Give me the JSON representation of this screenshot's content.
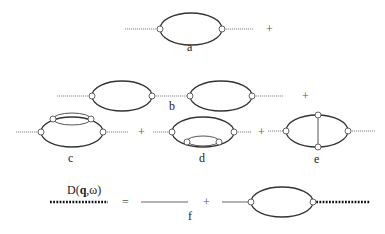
{
  "figure": {
    "diagrams": [
      {
        "id": "a",
        "label": "a",
        "description": "single bubble (polarization loop)"
      },
      {
        "id": "b",
        "label": "b",
        "description": "two bubbles connected in series"
      },
      {
        "id": "c",
        "label": "c",
        "description": "bubble with self-energy insertion on upper line"
      },
      {
        "id": "d",
        "label": "d",
        "description": "bubble with self-energy insertion on lower line"
      },
      {
        "id": "e",
        "label": "e",
        "description": "bubble with vertex correction (vertical rung)"
      },
      {
        "id": "f",
        "label": "f",
        "description": "Dyson equation for dressed propagator"
      }
    ],
    "operators": {
      "plus": "+",
      "equals": "="
    },
    "equation": {
      "lhs_label": "D(q,ω)",
      "lhs_label_prefix": "D(",
      "lhs_label_bold": "q",
      "lhs_label_suffix": ",ω)"
    }
  }
}
